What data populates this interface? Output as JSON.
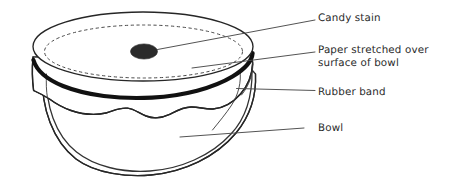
{
  "figure": {
    "title": "Bowl covered with stretched paper and a candy stain",
    "style": "hand-drawn line diagram",
    "background_color": "#ffffff",
    "ink_color": "#262626"
  },
  "labels": [
    {
      "id": "candy-stain",
      "text": "Candy stain",
      "points_to": "dark stain on the paper surface"
    },
    {
      "id": "paper",
      "text": "Paper stretched over\nsurface of bowl",
      "points_to": "paper membrane across bowl opening"
    },
    {
      "id": "rubber-band",
      "text": "Rubber band",
      "points_to": "thick black band around bowl rim"
    },
    {
      "id": "bowl",
      "text": "Bowl",
      "points_to": "rounded bowl body"
    }
  ],
  "parts": {
    "paper_top": "paper-membrane-ellipse",
    "bowl_rim_hidden": "dashed-rim-under-paper",
    "rubber_band": "rubber-band-stroke",
    "paper_skirt": "paper-overhang-wavy-edge",
    "bowl_body": "bowl-bowl-body",
    "candy_stain": "candy-stain-blob"
  },
  "colors": {
    "ink": "#262626",
    "rubber_band": "#111111",
    "stain": "#2b2b2b",
    "leader": "#4a4a4a",
    "paper": "#ffffff"
  }
}
